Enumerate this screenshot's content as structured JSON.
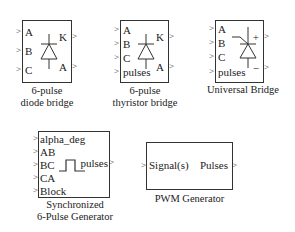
{
  "blocks": [
    {
      "id": "diode_bridge",
      "caption_lines": [
        "6-pulse",
        "diode bridge"
      ],
      "inputs": [
        "A",
        "B",
        "C"
      ],
      "outputs": [
        "K",
        "A"
      ],
      "symbol": "diode"
    },
    {
      "id": "thyristor_bridge",
      "caption_lines": [
        "6-pulse",
        "thyristor bridge"
      ],
      "inputs": [
        "A",
        "B",
        "C",
        "pulses"
      ],
      "outputs": [
        "K",
        "A"
      ],
      "symbol": "thyristor"
    },
    {
      "id": "universal_bridge",
      "caption_lines": [
        "Universal Bridge"
      ],
      "inputs": [
        "A",
        "B",
        "C",
        "pulses"
      ],
      "outputs": [
        "+",
        "−"
      ],
      "symbol": "gto"
    },
    {
      "id": "sync_pulse_generator",
      "caption_lines": [
        "Synchronized",
        "6-Pulse Generator"
      ],
      "inputs": [
        "alpha_deg",
        "AB",
        "BC",
        "CA",
        "Block"
      ],
      "outputs": [
        "pulses"
      ],
      "symbol": "pulse"
    },
    {
      "id": "pwm_generator",
      "caption_lines": [
        "PWM Generator"
      ],
      "inputs": [
        "Signal(s)"
      ],
      "outputs": [
        "Pulses"
      ],
      "symbol": "none"
    }
  ],
  "arrow_glyph": ">"
}
